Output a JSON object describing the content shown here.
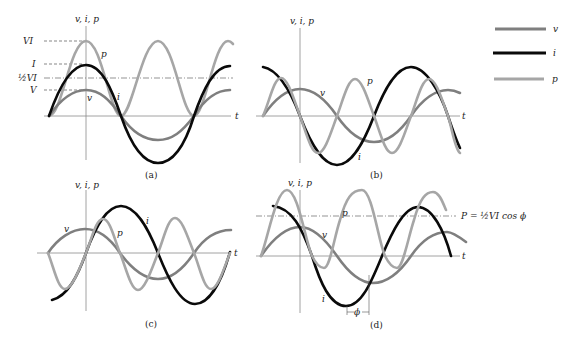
{
  "legend": {
    "items": [
      {
        "label": "v",
        "color": "#7f7f7f"
      },
      {
        "label": "i",
        "color": "#000000"
      },
      {
        "label": "p",
        "color": "#a6a6a6"
      }
    ]
  },
  "colors": {
    "v": "#7f7f7f",
    "i": "#0a0a0a",
    "p": "#a6a6a6"
  },
  "panels": [
    {
      "id": "a",
      "caption": "(a)",
      "y_axis_label": "v, i, p",
      "x_axis_label": "t",
      "curve_labels": {
        "p": "p",
        "v": "v",
        "i": "i"
      },
      "level_labels": {
        "VI": "VI",
        "I": "I",
        "half_VI": "½VI",
        "V": "V"
      },
      "description": "Resistive load: v and i in phase, p always non-negative"
    },
    {
      "id": "b",
      "caption": "(b)",
      "y_axis_label": "v, i, p",
      "x_axis_label": "t",
      "curve_labels": {
        "p": "p",
        "v": "v",
        "i": "i"
      },
      "description": "Current lags voltage by 90°, average power zero"
    },
    {
      "id": "c",
      "caption": "(c)",
      "y_axis_label": "v, i, p",
      "x_axis_label": "t",
      "curve_labels": {
        "p": "p",
        "v": "v",
        "i": "i"
      },
      "description": "Current leads voltage by 90°, average power zero"
    },
    {
      "id": "d",
      "caption": "(d)",
      "y_axis_label": "v, i, p",
      "x_axis_label": "t",
      "curve_labels": {
        "p": "p",
        "v": "v",
        "i": "i"
      },
      "power_label": "P = ½VI cos ϕ",
      "phase_label": "ϕ",
      "description": "General phase angle ϕ, average power P"
    }
  ]
}
